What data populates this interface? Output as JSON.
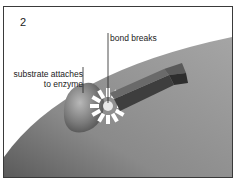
{
  "figure": {
    "step_number": "2",
    "labels": {
      "bond": "bond breaks",
      "substrate_line1": "substrate attaches",
      "substrate_line2": "to enzyme"
    },
    "colors": {
      "enzyme_surface": "#8c8c8c",
      "substrate": "#7a7a7a",
      "bar": "#4a4a4a",
      "burst": "#ffffff",
      "frame": "#3a3a3a"
    }
  }
}
